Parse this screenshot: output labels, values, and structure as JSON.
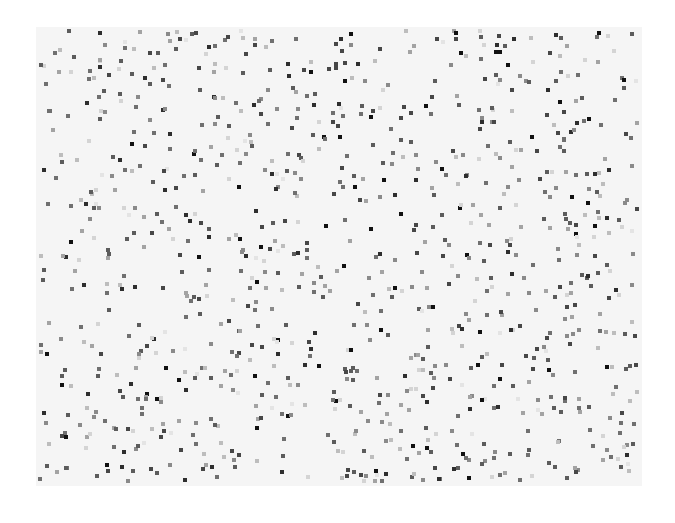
{
  "canvas": {
    "width": 675,
    "height": 523,
    "background": "#ffffff"
  },
  "field": {
    "x": 36,
    "y": 27,
    "width": 606,
    "height": 459,
    "background": "#f5f5f5"
  },
  "dots": {
    "count": 980,
    "size": 4,
    "seed": 1337,
    "shape": "square",
    "gray_levels": [
      "#111111",
      "#2e2e2e",
      "#474747",
      "#5c5c5c",
      "#707070",
      "#8a8a8a",
      "#a3a3a3",
      "#bdbdbd",
      "#d4d4d4",
      "#e4e4e4"
    ],
    "gray_weights": [
      0.06,
      0.08,
      0.12,
      0.14,
      0.14,
      0.12,
      0.11,
      0.1,
      0.08,
      0.05
    ]
  }
}
